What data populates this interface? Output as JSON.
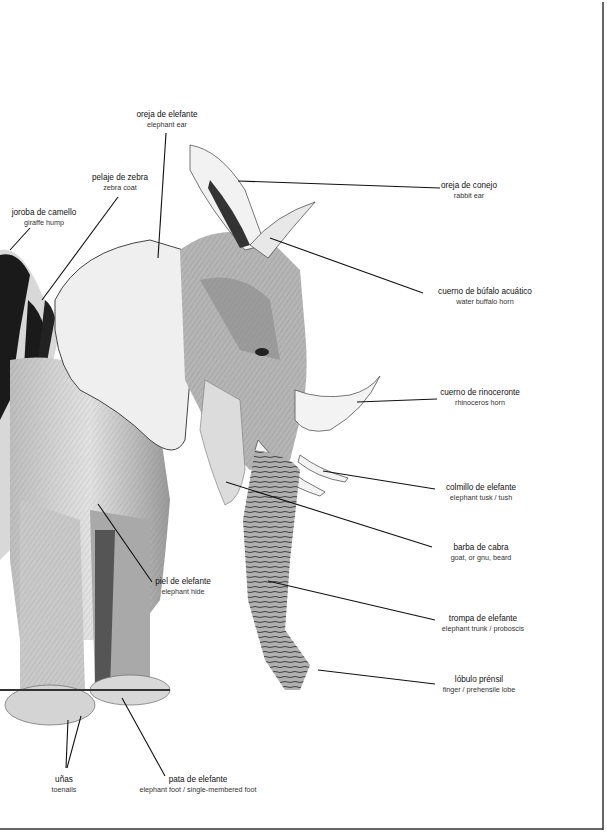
{
  "diagram": {
    "title": "",
    "frame": {
      "border_color": "#222222"
    },
    "labels": [
      {
        "id": "ear",
        "es": "oreja de elefante",
        "en": "elephant ear",
        "x": 167,
        "y": 110
      },
      {
        "id": "zebra-coat",
        "es": "pelaje de zebra",
        "en": "zebra coat",
        "x": 120,
        "y": 173
      },
      {
        "id": "hump",
        "es": "joroba de camello",
        "en": "giraffe hump",
        "x": 44,
        "y": 208
      },
      {
        "id": "rabbit-ear",
        "es": "oreja de conejo",
        "en": "rabbit ear",
        "x": 469,
        "y": 181
      },
      {
        "id": "buffalo-horn",
        "es": "cuerno de búfalo acuático",
        "en": "water buffalo horn",
        "x": 485,
        "y": 287
      },
      {
        "id": "rhino-horn",
        "es": "cuerno de rinoceronte",
        "en": "rhinoceros horn",
        "x": 480,
        "y": 388
      },
      {
        "id": "tusk",
        "es": "colmillo de elefante",
        "en": "elephant tusk / tush",
        "x": 481,
        "y": 483
      },
      {
        "id": "beard",
        "es": "barba de cabra",
        "en": "goat, or gnu, beard",
        "x": 481,
        "y": 543
      },
      {
        "id": "trunk",
        "es": "trompa de elefante",
        "en": "elephant trunk / proboscis",
        "x": 483,
        "y": 614
      },
      {
        "id": "lobe",
        "es": "lóbulo prénsil",
        "en": "finger / prehensile lobe",
        "x": 479,
        "y": 675
      },
      {
        "id": "hide",
        "es": "piel de elefante",
        "en": "elephant hide",
        "x": 183,
        "y": 577
      },
      {
        "id": "toenails",
        "es": "uñas",
        "en": "toenails",
        "x": 64,
        "y": 775
      },
      {
        "id": "foot",
        "es": "pata de elefante",
        "en": "elephant foot / single-membered foot",
        "x": 198,
        "y": 775
      }
    ]
  }
}
